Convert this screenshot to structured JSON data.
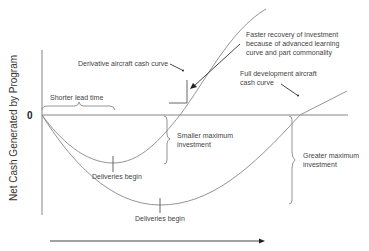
{
  "diagram": {
    "y_axis_label": "Net Cash Generated by Program",
    "zero_label": "0",
    "curves": {
      "derivative": {
        "label": "Derivative aircraft cash curve"
      },
      "full_development": {
        "label_line1": "Full development aircraft",
        "label_line2": "cash curve"
      }
    },
    "annotations": {
      "shorter_lead_time": "Shorter lead time",
      "faster_recovery_line1": "Faster recovery of investment",
      "faster_recovery_line2": "because of advanced learning",
      "faster_recovery_line3": "curve and part commonality",
      "smaller_max_line1": "Smaller maximum",
      "smaller_max_line2": "investment",
      "greater_max_line1": "Greater maximum",
      "greater_max_line2": "investment",
      "deliveries_begin_derivative": "Deliveries begin",
      "deliveries_begin_full": "Deliveries begin"
    }
  }
}
